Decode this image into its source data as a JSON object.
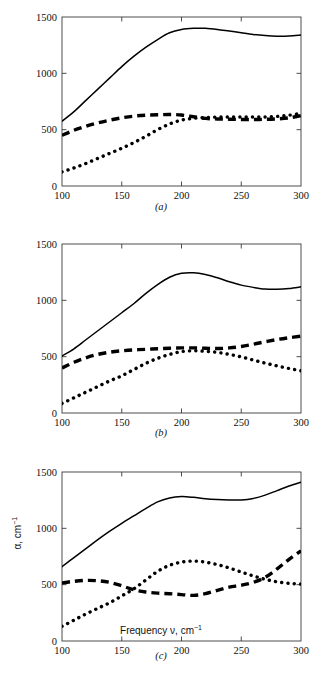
{
  "figure": {
    "axis_x_title_main": "Frequency ν, cm",
    "axis_x_title_sup": "−1",
    "axis_y_title_main": "α, cm",
    "axis_y_title_sup": "−1",
    "line_color": "#000000",
    "frame_color": "#3a3a3a",
    "background": "#ffffff"
  },
  "panels": [
    {
      "id": "a",
      "caption": "(a)"
    },
    {
      "id": "b",
      "caption": "(b)"
    },
    {
      "id": "c",
      "caption": "(c)"
    }
  ],
  "chart_data": [
    {
      "type": "line",
      "panel": "a",
      "title": "(a)",
      "xlabel": "Frequency ν, cm⁻¹",
      "ylabel": "α, cm⁻¹",
      "xlim": [
        100,
        300
      ],
      "ylim": [
        0,
        1500
      ],
      "xticks": [
        100,
        150,
        200,
        250,
        300
      ],
      "yticks": [
        0,
        500,
        1000,
        1500
      ],
      "xticklabels": [
        "100",
        "150",
        "200",
        "250",
        "300"
      ],
      "yticklabels": [
        "0",
        "500",
        "1000",
        "1500"
      ],
      "grid": false,
      "legend": "none",
      "x": [
        100,
        110,
        120,
        130,
        140,
        150,
        160,
        170,
        180,
        190,
        200,
        210,
        220,
        230,
        240,
        250,
        260,
        270,
        280,
        290,
        300
      ],
      "series": [
        {
          "name": "solid",
          "style": "solid",
          "values": [
            575,
            660,
            760,
            860,
            960,
            1060,
            1150,
            1230,
            1300,
            1360,
            1390,
            1400,
            1400,
            1390,
            1375,
            1360,
            1345,
            1335,
            1330,
            1332,
            1340
          ]
        },
        {
          "name": "dashed",
          "style": "dashed",
          "values": [
            450,
            495,
            530,
            560,
            585,
            605,
            620,
            628,
            632,
            635,
            630,
            615,
            600,
            595,
            593,
            590,
            590,
            592,
            596,
            605,
            625
          ]
        },
        {
          "name": "dotted",
          "style": "dotted",
          "values": [
            125,
            160,
            200,
            245,
            290,
            335,
            385,
            440,
            500,
            550,
            585,
            600,
            608,
            612,
            612,
            612,
            612,
            613,
            618,
            628,
            645
          ]
        }
      ]
    },
    {
      "type": "line",
      "panel": "b",
      "title": "(b)",
      "xlabel": "Frequency ν, cm⁻¹",
      "ylabel": "α, cm⁻¹",
      "xlim": [
        100,
        300
      ],
      "ylim": [
        0,
        1500
      ],
      "xticks": [
        100,
        150,
        200,
        250,
        300
      ],
      "yticks": [
        0,
        500,
        1000,
        1500
      ],
      "xticklabels": [
        "100",
        "150",
        "200",
        "250",
        "300"
      ],
      "yticklabels": [
        "0",
        "500",
        "1000",
        "1500"
      ],
      "grid": false,
      "legend": "none",
      "x": [
        100,
        110,
        120,
        130,
        140,
        150,
        160,
        170,
        180,
        190,
        200,
        210,
        220,
        230,
        240,
        250,
        260,
        270,
        280,
        290,
        300
      ],
      "series": [
        {
          "name": "solid",
          "style": "solid",
          "values": [
            505,
            570,
            650,
            730,
            810,
            890,
            970,
            1060,
            1140,
            1205,
            1240,
            1245,
            1230,
            1200,
            1165,
            1135,
            1115,
            1100,
            1098,
            1105,
            1120
          ]
        },
        {
          "name": "dashed",
          "style": "dashed",
          "values": [
            400,
            450,
            490,
            520,
            540,
            552,
            560,
            565,
            570,
            575,
            578,
            578,
            575,
            572,
            578,
            590,
            610,
            632,
            652,
            668,
            682
          ]
        },
        {
          "name": "dotted",
          "style": "dotted",
          "values": [
            85,
            135,
            185,
            235,
            285,
            330,
            385,
            440,
            485,
            520,
            545,
            552,
            548,
            538,
            520,
            498,
            470,
            443,
            418,
            395,
            375
          ]
        }
      ]
    },
    {
      "type": "line",
      "panel": "c",
      "title": "(c)",
      "xlabel": "Frequency ν, cm⁻¹",
      "ylabel": "α, cm⁻¹",
      "xlim": [
        100,
        300
      ],
      "ylim": [
        0,
        1500
      ],
      "xticks": [
        100,
        150,
        200,
        250,
        300
      ],
      "yticks": [
        0,
        500,
        1000,
        1500
      ],
      "xticklabels": [
        "100",
        "150",
        "200",
        "250",
        "300"
      ],
      "yticklabels": [
        "0",
        "500",
        "1000",
        "1500"
      ],
      "grid": false,
      "legend": "none",
      "x": [
        100,
        110,
        120,
        130,
        140,
        150,
        160,
        170,
        180,
        190,
        200,
        210,
        220,
        230,
        240,
        250,
        260,
        270,
        280,
        290,
        300
      ],
      "series": [
        {
          "name": "solid",
          "style": "solid",
          "values": [
            660,
            740,
            820,
            900,
            975,
            1045,
            1110,
            1175,
            1235,
            1270,
            1282,
            1275,
            1262,
            1255,
            1252,
            1252,
            1265,
            1295,
            1335,
            1375,
            1410
          ]
        },
        {
          "name": "dashed",
          "style": "dashed",
          "values": [
            515,
            530,
            538,
            535,
            520,
            490,
            455,
            435,
            425,
            420,
            412,
            405,
            420,
            450,
            478,
            495,
            520,
            565,
            640,
            725,
            800
          ]
        },
        {
          "name": "dotted",
          "style": "dotted",
          "values": [
            130,
            185,
            240,
            290,
            340,
            400,
            462,
            540,
            618,
            672,
            700,
            710,
            700,
            678,
            648,
            612,
            578,
            548,
            525,
            512,
            505
          ]
        }
      ]
    }
  ]
}
